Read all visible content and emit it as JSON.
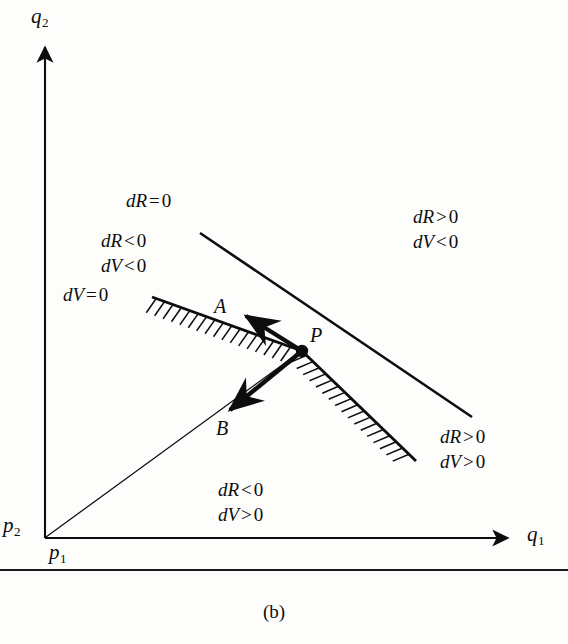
{
  "figure": {
    "caption": "(b)",
    "background_color": "#fdfdfc",
    "ink_color": "#0d0d0d",
    "axes": {
      "y_label": "q",
      "y_label_sub": "2",
      "x_label": "q",
      "x_label_sub": "1",
      "origin_label_left": "p",
      "origin_label_left_sub": "2",
      "origin_label_below": "p",
      "origin_label_below_sub": "1"
    },
    "point": {
      "name": "P"
    },
    "vectors": [
      {
        "name": "A",
        "label": "A"
      },
      {
        "name": "B",
        "label": "B"
      }
    ],
    "curve_labels": {
      "dR_zero": {
        "lhs": "dR",
        "rel": "=",
        "rhs": "0"
      },
      "dV_zero": {
        "lhs": "dV",
        "rel": "=",
        "rhs": "0"
      }
    },
    "region_labels": [
      {
        "name": "upper-right-region",
        "line1": {
          "lhs": "dR",
          "rel": ">",
          "rhs": "0"
        },
        "line2": {
          "lhs": "dV",
          "rel": "<",
          "rhs": "0"
        }
      },
      {
        "name": "upper-left-region",
        "line1": {
          "lhs": "dR",
          "rel": "<",
          "rhs": "0"
        },
        "line2": {
          "lhs": "dV",
          "rel": "<",
          "rhs": "0"
        }
      },
      {
        "name": "lower-right-region",
        "line1": {
          "lhs": "dR",
          "rel": ">",
          "rhs": "0"
        },
        "line2": {
          "lhs": "dV",
          "rel": ">",
          "rhs": "0"
        }
      },
      {
        "name": "lower-left-region",
        "line1": {
          "lhs": "dR",
          "rel": "<",
          "rhs": "0"
        },
        "line2": {
          "lhs": "dV",
          "rel": ">",
          "rhs": "0"
        }
      }
    ]
  }
}
